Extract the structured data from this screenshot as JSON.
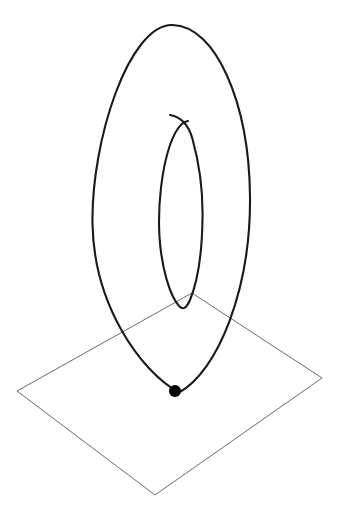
{
  "canvas": {
    "width": 340,
    "height": 513,
    "background_color": "#ffffff",
    "title": "",
    "caption": ""
  },
  "style": {
    "curve_color": "#1a1a1a",
    "curve_width": 2.1,
    "plane_color": "#5a5a5a",
    "plane_width": 0.9,
    "marker_color": "#000000",
    "marker_radius": 6
  },
  "chart_data": {
    "type": "line",
    "title": "",
    "subtitle": "",
    "xlabel": "",
    "ylabel": "",
    "grid": false,
    "legend": [],
    "annotations": [],
    "elements": [
      {
        "name": "plane",
        "type": "polygon",
        "closed": true,
        "points": [
          [
            17,
            391
          ],
          [
            192,
            293
          ],
          [
            322,
            378
          ],
          [
            155,
            495
          ]
        ]
      },
      {
        "name": "outer-loop",
        "type": "closed-curve",
        "center": [
          171,
          209
        ],
        "semi_major": 184,
        "semi_minor": 79,
        "rotation_deg": 3,
        "path": "M 172.5 25 C 216 26 249 103 250 196 C 251 289 218 371 179 392.5 C 140 371 94 305 92.5 224 C 91 141 129 24 172.5 25 Z"
      },
      {
        "name": "inner-spiral",
        "type": "open-curve",
        "start_point": [
          170,
          115
        ],
        "end_point": [
          188,
          307
        ],
        "path": "M 170 115 C 181 117 189 126 192.5 139 C 200 166 203 195 202.5 219 C 202 255 197 283 190 300 C 186 309 183 310 179 306 C 170 296 161.5 268 159.5 237 C 157.5 205 162 168 170 145 C 175 131 181 122 188 121"
      },
      {
        "name": "contact-point",
        "type": "marker",
        "position": [
          175,
          391
        ],
        "filled": true
      }
    ],
    "xlim": [
      0,
      340
    ],
    "ylim": [
      0,
      513
    ]
  }
}
